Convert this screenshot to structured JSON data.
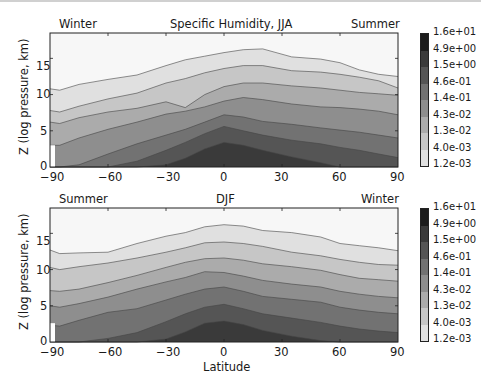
{
  "chart_data": [
    {
      "type": "heatmap",
      "subtype": "filled-contour",
      "title": "Specific Humidity, JJA",
      "left_annotation": "Winter",
      "right_annotation": "Summer",
      "xlabel": "",
      "ylabel": "Z (log pressure, km)",
      "xlim": [
        -90,
        90
      ],
      "ylim": [
        0,
        18.5
      ],
      "xticks": [
        -90,
        -60,
        -30,
        0,
        30,
        60,
        90
      ],
      "yticks": [
        0,
        5,
        10,
        15
      ],
      "colorbar_levels": [
        "1.2e-03",
        "4.0e-03",
        "1.3e-02",
        "4.3e-02",
        "1.4e-01",
        "4.6e-01",
        "1.5e+00",
        "4.9e+00",
        "1.6e+01"
      ],
      "contour_x": [
        -90,
        -85,
        -75,
        -60,
        -45,
        -30,
        -20,
        -10,
        0,
        10,
        20,
        35,
        50,
        60,
        70,
        80,
        90
      ],
      "contours": [
        {
          "level": "4.0e-03",
          "z": [
            10.8,
            10.6,
            11.4,
            12.1,
            12.7,
            14.0,
            14.8,
            15.3,
            15.8,
            16.2,
            16.3,
            15.2,
            14.9,
            14.4,
            13.4,
            12.8,
            12.5
          ]
        },
        {
          "level": "1.3e-02",
          "z": [
            7.8,
            7.6,
            8.4,
            9.4,
            10.2,
            11.6,
            12.2,
            13.0,
            13.6,
            14.0,
            14.0,
            13.3,
            13.1,
            12.8,
            12.4,
            11.9,
            10.9
          ]
        },
        {
          "level": "4.3e-02",
          "z": [
            6.2,
            6.0,
            6.8,
            7.6,
            8.1,
            9.0,
            8.2,
            10.0,
            11.1,
            11.6,
            11.6,
            11.2,
            10.9,
            10.6,
            10.3,
            10.1,
            9.9
          ]
        },
        {
          "level": "1.4e-01",
          "z": [
            3.0,
            3.0,
            4.0,
            5.2,
            6.2,
            7.3,
            7.7,
            8.3,
            9.1,
            9.6,
            9.3,
            8.7,
            8.3,
            8.2,
            8.0,
            7.7,
            7.2
          ]
        },
        {
          "level": "4.6e-01",
          "z": [
            0,
            0,
            0.3,
            1.8,
            3.2,
            4.4,
            5.2,
            6.2,
            7.2,
            6.9,
            6.3,
            5.9,
            5.4,
            5.1,
            4.8,
            4.4,
            4.0
          ]
        },
        {
          "level": "1.5e+00",
          "z": [
            0,
            0,
            0,
            0,
            0.8,
            2.3,
            3.4,
            4.6,
            5.6,
            5.0,
            4.4,
            3.7,
            3.2,
            2.7,
            2.3,
            1.8,
            1.3
          ]
        },
        {
          "level": "4.9e+00",
          "z": [
            0,
            0,
            0,
            0,
            0,
            0.3,
            1.2,
            2.5,
            3.4,
            3.0,
            2.3,
            1.4,
            0.6,
            0.0,
            0,
            0,
            0
          ]
        }
      ]
    },
    {
      "type": "heatmap",
      "subtype": "filled-contour",
      "title": "DJF",
      "left_annotation": "Summer",
      "right_annotation": "Winter",
      "xlabel": "Latitude",
      "ylabel": "Z (log pressure, km)",
      "xlim": [
        -90,
        90
      ],
      "ylim": [
        0,
        18.5
      ],
      "xticks": [
        -90,
        -60,
        -30,
        0,
        30,
        60,
        90
      ],
      "yticks": [
        0,
        5,
        10,
        15
      ],
      "colorbar_levels": [
        "1.2e-03",
        "4.0e-03",
        "1.3e-02",
        "4.3e-02",
        "1.4e-01",
        "4.6e-01",
        "1.5e+00",
        "4.9e+00",
        "1.6e+01"
      ],
      "contour_x": [
        -90,
        -85,
        -75,
        -60,
        -45,
        -30,
        -20,
        -10,
        0,
        10,
        20,
        35,
        50,
        60,
        70,
        80,
        90
      ],
      "contours": [
        {
          "level": "4.0e-03",
          "z": [
            12.7,
            12.2,
            12.3,
            12.4,
            13.6,
            14.6,
            15.1,
            15.9,
            16.2,
            16.0,
            15.4,
            15.1,
            14.5,
            13.6,
            13.3,
            13.0,
            12.6
          ]
        },
        {
          "level": "1.3e-02",
          "z": [
            10.3,
            10.0,
            10.4,
            10.9,
            11.6,
            12.4,
            13.0,
            13.7,
            13.8,
            13.6,
            13.2,
            12.4,
            11.9,
            11.4,
            11.0,
            10.7,
            10.6
          ]
        },
        {
          "level": "4.3e-02",
          "z": [
            7.1,
            7.0,
            7.3,
            8.2,
            9.2,
            10.3,
            11.0,
            11.5,
            11.6,
            11.3,
            10.8,
            10.4,
            9.9,
            9.3,
            8.8,
            8.6,
            8.4
          ]
        },
        {
          "level": "1.4e-01",
          "z": [
            5.0,
            4.8,
            5.3,
            6.2,
            7.3,
            8.3,
            8.9,
            9.7,
            9.6,
            9.1,
            8.5,
            8.0,
            7.6,
            7.0,
            6.6,
            6.3,
            6.1
          ]
        },
        {
          "level": "4.6e-01",
          "z": [
            2.3,
            2.2,
            3.0,
            4.1,
            4.6,
            5.8,
            6.6,
            7.3,
            7.6,
            7.0,
            6.3,
            5.9,
            5.5,
            4.8,
            4.4,
            4.1,
            3.9
          ]
        },
        {
          "level": "1.5e+00",
          "z": [
            0,
            0,
            0,
            0.5,
            1.3,
            2.8,
            3.9,
            4.8,
            5.2,
            4.6,
            3.9,
            3.3,
            2.7,
            2.2,
            1.8,
            1.5,
            1.3
          ]
        },
        {
          "level": "4.9e+00",
          "z": [
            0,
            0,
            0,
            0,
            0,
            0.4,
            1.4,
            2.6,
            2.9,
            2.4,
            1.6,
            0.8,
            0.2,
            0,
            0,
            0,
            0
          ]
        }
      ]
    }
  ],
  "panels": [
    {
      "title": "Specific Humidity, JJA",
      "left_label": "Winter",
      "right_label": "Summer",
      "ylabel": "Z (log pressure, km)",
      "xlabel": "",
      "xticks": [
        "−90",
        "−60",
        "−30",
        "0",
        "30",
        "60",
        "90"
      ],
      "yticks": [
        "0",
        "5",
        "10",
        "15"
      ]
    },
    {
      "title": "DJF",
      "left_label": "Summer",
      "right_label": "Winter",
      "ylabel": "Z (log pressure, km)",
      "xlabel": "Latitude",
      "xticks": [
        "−90",
        "−60",
        "−30",
        "0",
        "30",
        "60",
        "90"
      ],
      "yticks": [
        "0",
        "5",
        "10",
        "15"
      ]
    }
  ],
  "colorbar": {
    "labels": [
      "1.6e+01",
      "4.9e+00",
      "1.5e+00",
      "4.6e-01",
      "1.4e-01",
      "4.3e-02",
      "1.3e-02",
      "4.0e-03",
      "1.2e-03"
    ],
    "colors": [
      "#1c1c1c",
      "#3a3a3a",
      "#555555",
      "#727272",
      "#8e8e8e",
      "#ababab",
      "#c6c6c6",
      "#e0e0e0",
      "#f7f7f7"
    ]
  }
}
